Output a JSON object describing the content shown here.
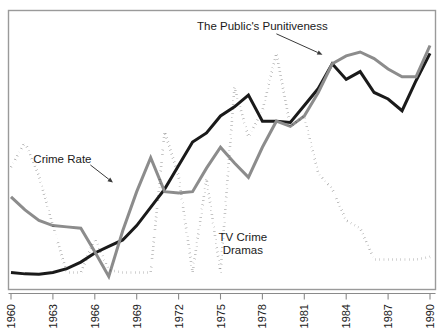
{
  "chart_data": {
    "type": "line",
    "title": "",
    "subtitle": "",
    "xlabel": "",
    "ylabel": "",
    "grid": false,
    "legend_position": "inline-annotations",
    "xlim": [
      1960,
      1990
    ],
    "ylim": [
      0,
      100
    ],
    "x": [
      1960,
      1961,
      1962,
      1963,
      1964,
      1965,
      1966,
      1967,
      1968,
      1969,
      1970,
      1971,
      1972,
      1973,
      1974,
      1975,
      1976,
      1977,
      1978,
      1979,
      1980,
      1981,
      1982,
      1983,
      1984,
      1985,
      1986,
      1987,
      1988,
      1989,
      1990
    ],
    "xticks": [
      1960,
      1963,
      1966,
      1969,
      1972,
      1975,
      1978,
      1981,
      1984,
      1987,
      1990
    ],
    "xticklabels": [
      "1960",
      "1963",
      "1966",
      "1969",
      "1972",
      "1975",
      "1978",
      "1981",
      "1984",
      "1987",
      "1990"
    ],
    "series": [
      {
        "name": "Crime Rate",
        "style": "solid",
        "color": "#1a1a1a",
        "width": 3.0,
        "label_text": "Crime Rate",
        "label_x": 1961.6,
        "label_y": 46.0,
        "arrow_to_x": 1967.3,
        "arrow_to_y": 38.5,
        "values": [
          4.0,
          3.5,
          3.4,
          4.0,
          5.5,
          8.0,
          11.5,
          14.0,
          16.5,
          22.0,
          29.0,
          36.0,
          45.0,
          54.0,
          57.5,
          64.0,
          67.5,
          72.0,
          62.0,
          62.0,
          61.5,
          68.0,
          74.5,
          84.0,
          78.0,
          81.0,
          73.0,
          70.5,
          66.0,
          77.5,
          88.0
        ]
      },
      {
        "name": "The Public's Punitiveness",
        "style": "solid",
        "color": "#8c8c8c",
        "width": 3.0,
        "label_text": "The Public's Punitiveness",
        "label_x": 1978.0,
        "label_y": 97.0,
        "arrow_to_x": 1982.3,
        "arrow_to_y": 87.5,
        "values": [
          33.0,
          28.0,
          24.0,
          22.0,
          21.5,
          21.0,
          12.0,
          2.5,
          20.0,
          35.0,
          48.0,
          35.0,
          34.5,
          35.0,
          44.0,
          52.0,
          46.0,
          40.5,
          52.0,
          62.0,
          60.0,
          64.0,
          73.0,
          84.0,
          87.0,
          88.5,
          86.0,
          82.0,
          79.0,
          79.0,
          91.0
        ]
      },
      {
        "name": "TV Crime Dramas",
        "style": "dotted",
        "color": "#1a1a1a",
        "width": 2.6,
        "label_text": "TV Crime\nDramas",
        "label_line1": "TV Crime",
        "label_line2": "Dramas",
        "label_x": 1976.6,
        "label_y": 16.0,
        "values": [
          44.5,
          54.0,
          41.0,
          22.0,
          4.0,
          4.0,
          17.0,
          5.0,
          4.0,
          4.0,
          4.0,
          58.0,
          41.0,
          4.0,
          40.0,
          4.0,
          75.0,
          56.0,
          66.0,
          88.0,
          60.0,
          64.0,
          42.0,
          36.0,
          24.0,
          21.0,
          9.0,
          9.0,
          9.0,
          9.0,
          10.0
        ]
      }
    ]
  },
  "annotations": {
    "crime_rate_label": "Crime Rate",
    "punitiveness_label": "The Public's Punitiveness",
    "tv_drama_label_line1": "TV Crime",
    "tv_drama_label_line2": "Dramas"
  },
  "axis": {
    "x_tick_labels": [
      "1960",
      "1963",
      "1966",
      "1969",
      "1972",
      "1975",
      "1978",
      "1981",
      "1984",
      "1987",
      "1990"
    ],
    "x_label_rotation": "-90"
  },
  "colors": {
    "crime_rate": "#1a1a1a",
    "punitiveness": "#8c8c8c",
    "tv_crime_dramas": "#1a1a1a",
    "frame": "#9a9a9a",
    "background": "#ffffff"
  }
}
